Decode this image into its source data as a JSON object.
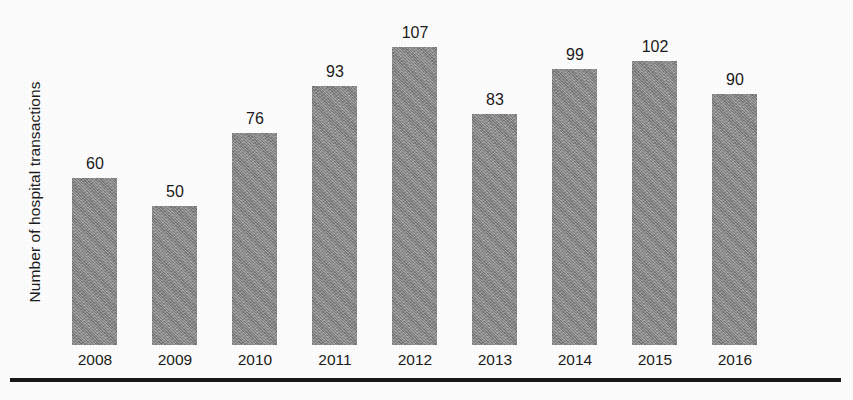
{
  "chart_data": {
    "type": "bar",
    "title": "",
    "subtitle": "",
    "xlabel": "",
    "ylabel": "Number of hospital transactions",
    "categories": [
      "2008",
      "2009",
      "2010",
      "2011",
      "2012",
      "2013",
      "2014",
      "2015",
      "2016"
    ],
    "values": [
      60,
      50,
      76,
      93,
      107,
      83,
      99,
      102,
      90
    ],
    "data_labels": [
      "60",
      "50",
      "76",
      "93",
      "107",
      "83",
      "99",
      "102",
      "90"
    ],
    "ylim": [
      0,
      107
    ],
    "grid": false,
    "legend": null,
    "legend_position": "none",
    "annotations": [],
    "bar_color": "#8f8f8f",
    "text_color": "#1b1b1b",
    "background_color": "#fdfdfd",
    "rule_color": "#17181a",
    "y_axis_visible": false,
    "x_axis_visible": false,
    "value_labels_shown": true
  },
  "figure": {
    "bottom_rule_label": ""
  }
}
